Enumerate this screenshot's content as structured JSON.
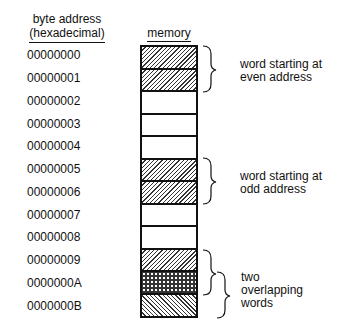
{
  "headers": {
    "address_line1": "byte address",
    "address_line2": "(hexadecimal)",
    "memory": "memory"
  },
  "addresses": [
    "00000000",
    "00000001",
    "00000002",
    "00000003",
    "00000004",
    "00000005",
    "00000006",
    "00000007",
    "00000008",
    "00000009",
    "0000000A",
    "0000000B"
  ],
  "cells": [
    {
      "pattern": "forward-hatch"
    },
    {
      "pattern": "forward-hatch"
    },
    {
      "pattern": "none"
    },
    {
      "pattern": "none"
    },
    {
      "pattern": "none"
    },
    {
      "pattern": "forward-hatch"
    },
    {
      "pattern": "forward-hatch"
    },
    {
      "pattern": "none"
    },
    {
      "pattern": "none"
    },
    {
      "pattern": "forward-hatch"
    },
    {
      "pattern": "cross-hatch"
    },
    {
      "pattern": "back-hatch"
    }
  ],
  "annotations": {
    "even_line1": "word starting at",
    "even_line2": "even address",
    "odd_line1": "word starting at",
    "odd_line2": "odd address",
    "overlap_line1": "two",
    "overlap_line2": "overlapping",
    "overlap_line3": "words"
  }
}
